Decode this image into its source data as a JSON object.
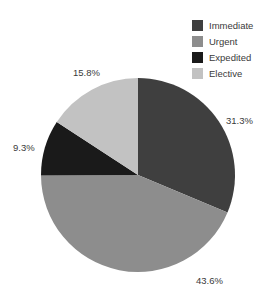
{
  "chart_data": {
    "type": "pie",
    "title": "",
    "categories": [
      "Immediate",
      "Urgent",
      "Expedited",
      "Elective"
    ],
    "values": [
      31.3,
      43.6,
      9.3,
      15.8
    ],
    "value_labels": [
      "31.3%",
      "43.6%",
      "9.3%",
      "15.8%"
    ],
    "units": "percent",
    "start_angle_deg": 90,
    "direction": "clockwise",
    "legend_position": "top-right",
    "grid": false,
    "colors": [
      "#3f3f3f",
      "#8d8d8d",
      "#1a1a1a",
      "#c2c2c2"
    ],
    "slices": [
      {
        "label": "Immediate",
        "value": 31.3,
        "display": "31.3%",
        "color": "#3f3f3f"
      },
      {
        "label": "Urgent",
        "value": 43.6,
        "display": "43.6%",
        "color": "#8d8d8d"
      },
      {
        "label": "Expedited",
        "value": 9.3,
        "display": "9.3%",
        "color": "#1a1a1a"
      },
      {
        "label": "Elective",
        "value": 15.8,
        "display": "15.8%",
        "color": "#c2c2c2"
      }
    ]
  },
  "legend": {
    "items": [
      {
        "label": "Immediate",
        "color": "#3f3f3f"
      },
      {
        "label": "Urgent",
        "color": "#8d8d8d"
      },
      {
        "label": "Expedited",
        "color": "#1a1a1a"
      },
      {
        "label": "Elective",
        "color": "#c2c2c2"
      }
    ]
  },
  "labels": {
    "immediate_pct": "31.3%",
    "urgent_pct": "43.6%",
    "expedited_pct": "9.3%",
    "elective_pct": "15.8%"
  },
  "colors": {
    "background": "#ffffff",
    "text": "#3a3a3a"
  }
}
